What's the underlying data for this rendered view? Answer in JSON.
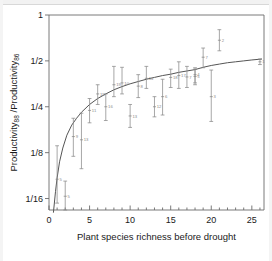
{
  "chart_data": {
    "type": "scatter",
    "title": "",
    "xlabel": "Plant species richness before drought",
    "ylabel_main": "Productivity",
    "ylabel_sub1": "88",
    "ylabel_mid": " /Productivity",
    "ylabel_sub2": "86",
    "ylabel": "Productivity88 /Productivity86",
    "xlim": [
      0,
      26.5
    ],
    "ylim_log2": [
      -4.25,
      0
    ],
    "grid": false,
    "legend": "none",
    "yscale": "log2",
    "x_ticks": [
      0,
      5,
      10,
      15,
      20,
      25
    ],
    "x_tick_labels": [
      "0",
      "5",
      "10",
      "15",
      "20",
      "25"
    ],
    "x_minor_tick_step": 1,
    "y_ticks_log2": [
      0,
      -1,
      -2,
      -3,
      -4
    ],
    "y_tick_labels": [
      "1",
      "1/2",
      "1/4",
      "1/8",
      "1/16"
    ],
    "marker": "point-with-vertical-error-bar",
    "point_color": "#8a8a8a",
    "curve_color": "#555555",
    "axis_color": "#6b6b6b",
    "curve_description": "fitted saturating (Michaelis-Menten-like) curve rising steeply from near 1/20 at x=0.6 and asymptoting just above 1/2 at x=26",
    "curve_points": [
      {
        "x": 0.55,
        "y_log2": -4.3
      },
      {
        "x": 0.8,
        "y_log2": -3.85
      },
      {
        "x": 1.0,
        "y_log2": -3.55
      },
      {
        "x": 1.3,
        "y_log2": -3.2
      },
      {
        "x": 1.7,
        "y_log2": -2.9
      },
      {
        "x": 2.2,
        "y_log2": -2.62
      },
      {
        "x": 2.8,
        "y_log2": -2.4
      },
      {
        "x": 3.4,
        "y_log2": -2.25
      },
      {
        "x": 4.0,
        "y_log2": -2.12
      },
      {
        "x": 5.0,
        "y_log2": -1.95
      },
      {
        "x": 6.0,
        "y_log2": -1.82
      },
      {
        "x": 7.0,
        "y_log2": -1.72
      },
      {
        "x": 8.0,
        "y_log2": -1.63
      },
      {
        "x": 9.0,
        "y_log2": -1.56
      },
      {
        "x": 10.0,
        "y_log2": -1.5
      },
      {
        "x": 11.0,
        "y_log2": -1.45
      },
      {
        "x": 12.0,
        "y_log2": -1.4
      },
      {
        "x": 13.0,
        "y_log2": -1.36
      },
      {
        "x": 14.0,
        "y_log2": -1.32
      },
      {
        "x": 15.0,
        "y_log2": -1.29
      },
      {
        "x": 16.0,
        "y_log2": -1.25
      },
      {
        "x": 17.0,
        "y_log2": -1.22
      },
      {
        "x": 18.0,
        "y_log2": -1.19
      },
      {
        "x": 19.0,
        "y_log2": -1.14
      },
      {
        "x": 20.0,
        "y_log2": -1.1
      },
      {
        "x": 21.0,
        "y_log2": -1.07
      },
      {
        "x": 22.0,
        "y_log2": -1.04
      },
      {
        "x": 23.0,
        "y_log2": -1.02
      },
      {
        "x": 24.0,
        "y_log2": -1.0
      },
      {
        "x": 25.0,
        "y_log2": -0.98
      },
      {
        "x": 26.2,
        "y_log2": -0.96
      }
    ],
    "points": [
      {
        "x": 1,
        "y_log2": -3.58,
        "lo_log2": -4.1,
        "hi_log2": -2.85,
        "n": "5"
      },
      {
        "x": 2,
        "y_log2": -3.95,
        "lo_log2": -4.25,
        "hi_log2": -3.62,
        "n": "5"
      },
      {
        "x": 3,
        "y_log2": -2.65,
        "lo_log2": -3.08,
        "hi_log2": -2.25,
        "n": "9"
      },
      {
        "x": 4,
        "y_log2": -2.72,
        "lo_log2": -3.35,
        "hi_log2": -2.14,
        "n": "13"
      },
      {
        "x": 5,
        "y_log2": -2.08,
        "lo_log2": -2.35,
        "hi_log2": -1.82,
        "n": "11"
      },
      {
        "x": 6,
        "y_log2": -1.72,
        "lo_log2": -1.95,
        "hi_log2": -1.52,
        "n": "15"
      },
      {
        "x": 7,
        "y_log2": -2.0,
        "lo_log2": -2.3,
        "hi_log2": -1.72,
        "n": "16"
      },
      {
        "x": 8,
        "y_log2": -1.52,
        "lo_log2": -1.78,
        "hi_log2": -1.12,
        "n": "19"
      },
      {
        "x": 9,
        "y_log2": -1.48,
        "lo_log2": -1.72,
        "hi_log2": -1.14,
        "n": "10"
      },
      {
        "x": 10,
        "y_log2": -2.2,
        "lo_log2": -2.45,
        "hi_log2": -1.95,
        "n": "13"
      },
      {
        "x": 11,
        "y_log2": -1.55,
        "lo_log2": -1.8,
        "hi_log2": -1.3,
        "n": "8"
      },
      {
        "x": 12,
        "y_log2": -1.38,
        "lo_log2": -1.6,
        "hi_log2": -1.12,
        "n": "14"
      },
      {
        "x": 13,
        "y_log2": -2.0,
        "lo_log2": -2.22,
        "hi_log2": -1.78,
        "n": "12"
      },
      {
        "x": 14,
        "y_log2": -1.78,
        "lo_log2": -2.18,
        "hi_log2": -1.4,
        "n": "6"
      },
      {
        "x": 15,
        "y_log2": -1.36,
        "lo_log2": -1.58,
        "hi_log2": -1.18,
        "n": "18"
      },
      {
        "x": 16,
        "y_log2": -1.32,
        "lo_log2": -1.6,
        "hi_log2": -1.02,
        "n": "17"
      },
      {
        "x": 17,
        "y_log2": -1.35,
        "lo_log2": -1.58,
        "hi_log2": -1.12,
        "n": "7"
      },
      {
        "x": 18,
        "y_log2": -1.3,
        "lo_log2": -1.48,
        "hi_log2": -1.15,
        "n": "4"
      },
      {
        "x": 18,
        "y_log2": -1.34,
        "lo_log2": -1.52,
        "hi_log2": -1.18,
        "n": "5"
      },
      {
        "x": 19,
        "y_log2": -0.92,
        "lo_log2": -1.15,
        "hi_log2": -0.72,
        "n": "7"
      },
      {
        "x": 20,
        "y_log2": -1.78,
        "lo_log2": -2.32,
        "hi_log2": -1.2,
        "n": "3"
      },
      {
        "x": 21,
        "y_log2": -0.55,
        "lo_log2": -0.78,
        "hi_log2": -0.32,
        "n": "2"
      },
      {
        "x": 26,
        "y_log2": -1.02,
        "lo_log2": -1.08,
        "hi_log2": -0.96,
        "n": "1"
      }
    ]
  }
}
